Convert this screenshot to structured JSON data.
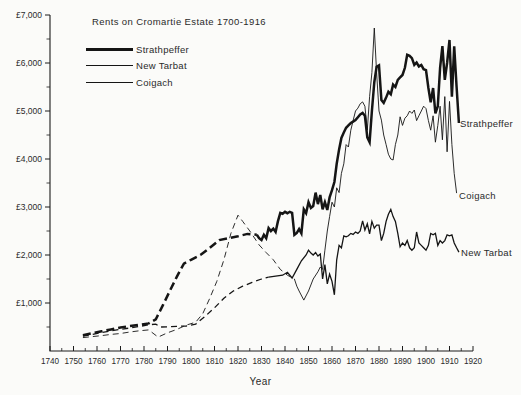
{
  "title": "Rents on Cromartie Estate 1700-1916",
  "x_axis_title": "Year",
  "chart_data": {
    "type": "line",
    "title": "Rents on Cromartie Estate 1700-1916",
    "xlabel": "Year",
    "ylabel": "Rent (£)",
    "xlim": [
      1740,
      1920
    ],
    "ylim": [
      0,
      7000
    ],
    "x_tick_interval": 10,
    "x_minor_tick_interval": 5,
    "y_tick_interval": 1000,
    "y_minor_tick_interval": 500,
    "grid": "off",
    "legend_position": "top-left-inset",
    "axis_color": "#1c1c1c",
    "line_color": "#151515",
    "x_tick_labels": [
      "1740",
      "1750",
      "1760",
      "1770",
      "1780",
      "1790",
      "1800",
      "1810",
      "1820",
      "1830",
      "1840",
      "1850",
      "1860",
      "1870",
      "1880",
      "1890",
      "1900",
      "1910",
      "1920"
    ],
    "y_tick_values": [
      1000,
      2000,
      3000,
      4000,
      5000,
      6000,
      7000
    ],
    "y_tick_labels": [
      "£1,000",
      "£2,000",
      "£3,000",
      "£4,000",
      "£5,000",
      "£6,000",
      "£7,000"
    ],
    "series": [
      {
        "name": "Coigach",
        "stroke_width": 0.9,
        "dash_until": 1844,
        "points": [
          [
            1754,
            280
          ],
          [
            1758,
            300
          ],
          [
            1762,
            320
          ],
          [
            1766,
            345
          ],
          [
            1770,
            365
          ],
          [
            1774,
            395
          ],
          [
            1778,
            420
          ],
          [
            1782,
            440
          ],
          [
            1786,
            290
          ],
          [
            1790,
            380
          ],
          [
            1794,
            450
          ],
          [
            1798,
            540
          ],
          [
            1802,
            600
          ],
          [
            1805,
            780
          ],
          [
            1808,
            1100
          ],
          [
            1811,
            1450
          ],
          [
            1814,
            1900
          ],
          [
            1817,
            2450
          ],
          [
            1820,
            2830
          ],
          [
            1822,
            2700
          ],
          [
            1825,
            2500
          ],
          [
            1829,
            2210
          ],
          [
            1832,
            2050
          ],
          [
            1835,
            1900
          ],
          [
            1838,
            1700
          ],
          [
            1841,
            1580
          ],
          [
            1844,
            1500
          ],
          [
            1845,
            1350
          ],
          [
            1846,
            1250
          ],
          [
            1848,
            1060
          ],
          [
            1850,
            1250
          ],
          [
            1852,
            1500
          ],
          [
            1854,
            1650
          ],
          [
            1855,
            1750
          ],
          [
            1856,
            1700
          ],
          [
            1857,
            2100
          ],
          [
            1858,
            2500
          ],
          [
            1859,
            2800
          ],
          [
            1860,
            3100
          ],
          [
            1861,
            3000
          ],
          [
            1862,
            3400
          ],
          [
            1863,
            3300
          ],
          [
            1864,
            3700
          ],
          [
            1865,
            3900
          ],
          [
            1866,
            4300
          ],
          [
            1867,
            4250
          ],
          [
            1868,
            4600
          ],
          [
            1869,
            4800
          ],
          [
            1870,
            5000
          ],
          [
            1871,
            5060
          ],
          [
            1872,
            5150
          ],
          [
            1873,
            5190
          ],
          [
            1874,
            5100
          ],
          [
            1875,
            4600
          ],
          [
            1876,
            5300
          ],
          [
            1877,
            5800
          ],
          [
            1878,
            6730
          ],
          [
            1879,
            5800
          ],
          [
            1880,
            5000
          ],
          [
            1881,
            4810
          ],
          [
            1882,
            4500
          ],
          [
            1883,
            4300
          ],
          [
            1884,
            4100
          ],
          [
            1885,
            4000
          ],
          [
            1886,
            3980
          ],
          [
            1887,
            4300
          ],
          [
            1888,
            4500
          ],
          [
            1889,
            4880
          ],
          [
            1890,
            4700
          ],
          [
            1891,
            4850
          ],
          [
            1892,
            4900
          ],
          [
            1893,
            5000
          ],
          [
            1894,
            4950
          ],
          [
            1895,
            5020
          ],
          [
            1896,
            4800
          ],
          [
            1897,
            4900
          ],
          [
            1898,
            5000
          ],
          [
            1899,
            5100
          ],
          [
            1900,
            5050
          ],
          [
            1901,
            4800
          ],
          [
            1902,
            4600
          ],
          [
            1903,
            4900
          ],
          [
            1904,
            4350
          ],
          [
            1905,
            4700
          ],
          [
            1906,
            5100
          ],
          [
            1907,
            4400
          ],
          [
            1908,
            5300
          ],
          [
            1909,
            4150
          ],
          [
            1910,
            5200
          ],
          [
            1911,
            4300
          ],
          [
            1912,
            3700
          ],
          [
            1913,
            3290
          ]
        ]
      },
      {
        "name": "New Tarbat",
        "stroke_width": 1.3,
        "dash_until": 1833,
        "points": [
          [
            1754,
            310
          ],
          [
            1758,
            345
          ],
          [
            1762,
            385
          ],
          [
            1766,
            420
          ],
          [
            1770,
            450
          ],
          [
            1774,
            480
          ],
          [
            1778,
            510
          ],
          [
            1782,
            545
          ],
          [
            1785,
            560
          ],
          [
            1787,
            500
          ],
          [
            1790,
            505
          ],
          [
            1794,
            515
          ],
          [
            1798,
            520
          ],
          [
            1802,
            560
          ],
          [
            1806,
            720
          ],
          [
            1810,
            900
          ],
          [
            1814,
            1100
          ],
          [
            1818,
            1250
          ],
          [
            1822,
            1350
          ],
          [
            1826,
            1430
          ],
          [
            1830,
            1500
          ],
          [
            1833,
            1540
          ],
          [
            1836,
            1560
          ],
          [
            1839,
            1580
          ],
          [
            1841,
            1640
          ],
          [
            1843,
            1520
          ],
          [
            1845,
            1700
          ],
          [
            1847,
            1880
          ],
          [
            1849,
            2000
          ],
          [
            1850,
            2100
          ],
          [
            1851,
            2040
          ],
          [
            1852,
            2000
          ],
          [
            1853,
            2050
          ],
          [
            1854,
            1980
          ],
          [
            1855,
            2020
          ],
          [
            1856,
            1500
          ],
          [
            1857,
            1800
          ],
          [
            1858,
            1400
          ],
          [
            1859,
            1600
          ],
          [
            1860,
            1450
          ],
          [
            1861,
            1170
          ],
          [
            1862,
            1900
          ],
          [
            1863,
            2200
          ],
          [
            1864,
            2150
          ],
          [
            1865,
            2400
          ],
          [
            1866,
            2380
          ],
          [
            1867,
            2400
          ],
          [
            1868,
            2450
          ],
          [
            1869,
            2430
          ],
          [
            1870,
            2480
          ],
          [
            1871,
            2450
          ],
          [
            1872,
            2500
          ],
          [
            1873,
            2710
          ],
          [
            1874,
            2520
          ],
          [
            1875,
            2650
          ],
          [
            1876,
            2440
          ],
          [
            1877,
            2700
          ],
          [
            1878,
            2560
          ],
          [
            1879,
            2620
          ],
          [
            1880,
            2620
          ],
          [
            1881,
            2300
          ],
          [
            1882,
            2450
          ],
          [
            1883,
            2700
          ],
          [
            1884,
            2850
          ],
          [
            1885,
            2950
          ],
          [
            1886,
            2800
          ],
          [
            1887,
            2700
          ],
          [
            1888,
            2450
          ],
          [
            1889,
            2170
          ],
          [
            1890,
            2250
          ],
          [
            1891,
            2200
          ],
          [
            1892,
            2300
          ],
          [
            1893,
            2150
          ],
          [
            1894,
            2100
          ],
          [
            1895,
            2150
          ],
          [
            1896,
            2480
          ],
          [
            1897,
            2250
          ],
          [
            1898,
            2200
          ],
          [
            1899,
            2150
          ],
          [
            1900,
            2100
          ],
          [
            1901,
            2200
          ],
          [
            1902,
            2450
          ],
          [
            1903,
            2420
          ],
          [
            1904,
            2450
          ],
          [
            1905,
            2200
          ],
          [
            1906,
            2300
          ],
          [
            1907,
            2250
          ],
          [
            1908,
            2300
          ],
          [
            1909,
            2420
          ],
          [
            1910,
            2400
          ],
          [
            1911,
            2420
          ],
          [
            1912,
            2250
          ],
          [
            1913,
            2150
          ],
          [
            1914,
            2060
          ]
        ]
      },
      {
        "name": "Strathpeffer",
        "stroke_width": 2.5,
        "dash_until": 1828,
        "points": [
          [
            1754,
            330
          ],
          [
            1758,
            370
          ],
          [
            1762,
            410
          ],
          [
            1766,
            450
          ],
          [
            1770,
            490
          ],
          [
            1774,
            520
          ],
          [
            1778,
            545
          ],
          [
            1782,
            575
          ],
          [
            1785,
            660
          ],
          [
            1788,
            950
          ],
          [
            1791,
            1250
          ],
          [
            1794,
            1550
          ],
          [
            1797,
            1820
          ],
          [
            1800,
            1900
          ],
          [
            1804,
            2000
          ],
          [
            1808,
            2150
          ],
          [
            1812,
            2310
          ],
          [
            1816,
            2350
          ],
          [
            1820,
            2390
          ],
          [
            1824,
            2440
          ],
          [
            1828,
            2420
          ],
          [
            1829,
            2350
          ],
          [
            1830,
            2310
          ],
          [
            1831,
            2420
          ],
          [
            1832,
            2350
          ],
          [
            1833,
            2560
          ],
          [
            1834,
            2500
          ],
          [
            1835,
            2550
          ],
          [
            1836,
            2480
          ],
          [
            1837,
            2700
          ],
          [
            1838,
            2880
          ],
          [
            1839,
            2860
          ],
          [
            1840,
            2900
          ],
          [
            1841,
            2870
          ],
          [
            1842,
            2900
          ],
          [
            1843,
            2880
          ],
          [
            1844,
            2420
          ],
          [
            1845,
            2460
          ],
          [
            1846,
            2540
          ],
          [
            1847,
            2450
          ],
          [
            1848,
            2950
          ],
          [
            1849,
            2870
          ],
          [
            1850,
            3100
          ],
          [
            1851,
            2980
          ],
          [
            1852,
            3020
          ],
          [
            1853,
            3300
          ],
          [
            1854,
            3060
          ],
          [
            1855,
            3250
          ],
          [
            1856,
            2950
          ],
          [
            1857,
            3100
          ],
          [
            1858,
            2940
          ],
          [
            1859,
            3200
          ],
          [
            1860,
            3350
          ],
          [
            1861,
            3520
          ],
          [
            1862,
            3900
          ],
          [
            1863,
            4200
          ],
          [
            1864,
            4440
          ],
          [
            1865,
            4550
          ],
          [
            1866,
            4650
          ],
          [
            1867,
            4700
          ],
          [
            1868,
            4750
          ],
          [
            1869,
            4780
          ],
          [
            1870,
            4810
          ],
          [
            1871,
            4870
          ],
          [
            1872,
            4930
          ],
          [
            1873,
            4960
          ],
          [
            1874,
            4900
          ],
          [
            1875,
            4450
          ],
          [
            1876,
            4350
          ],
          [
            1877,
            5000
          ],
          [
            1878,
            5600
          ],
          [
            1879,
            5920
          ],
          [
            1880,
            5950
          ],
          [
            1881,
            5230
          ],
          [
            1882,
            5170
          ],
          [
            1883,
            5280
          ],
          [
            1884,
            5400
          ],
          [
            1885,
            5350
          ],
          [
            1886,
            5550
          ],
          [
            1887,
            5500
          ],
          [
            1888,
            5650
          ],
          [
            1889,
            5700
          ],
          [
            1890,
            5750
          ],
          [
            1891,
            5900
          ],
          [
            1892,
            6170
          ],
          [
            1893,
            6150
          ],
          [
            1894,
            6100
          ],
          [
            1895,
            5960
          ],
          [
            1896,
            6010
          ],
          [
            1897,
            5930
          ],
          [
            1898,
            5960
          ],
          [
            1899,
            5870
          ],
          [
            1900,
            5850
          ],
          [
            1901,
            5480
          ],
          [
            1902,
            5180
          ],
          [
            1903,
            5480
          ],
          [
            1904,
            4950
          ],
          [
            1905,
            5100
          ],
          [
            1906,
            5900
          ],
          [
            1907,
            6350
          ],
          [
            1908,
            5650
          ],
          [
            1909,
            6000
          ],
          [
            1910,
            6480
          ],
          [
            1911,
            5300
          ],
          [
            1912,
            6350
          ],
          [
            1913,
            5500
          ],
          [
            1914,
            4750
          ]
        ]
      }
    ],
    "legend_order": [
      "Strathpeffer",
      "New Tarbat",
      "Coigach"
    ]
  },
  "legend": {
    "items": [
      {
        "label": "Strathpeffer"
      },
      {
        "label": "New Tarbat"
      },
      {
        "label": "Coigach"
      }
    ]
  },
  "end_labels": {
    "strathpeffer": "Strathpeffer",
    "coigach": "Coigach",
    "new_tarbat": "New Tarbat"
  }
}
